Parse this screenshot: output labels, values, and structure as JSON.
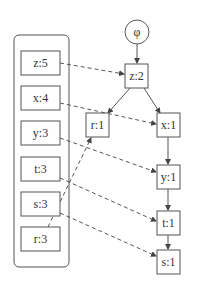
{
  "diagram": {
    "root": {
      "id": "phi",
      "label": "φ"
    },
    "left_group": {
      "items": [
        {
          "id": "z5",
          "label": "z:5"
        },
        {
          "id": "x4",
          "label": "x:4"
        },
        {
          "id": "y3",
          "label": "y:3"
        },
        {
          "id": "t3",
          "label": "t:3"
        },
        {
          "id": "s3",
          "label": "s:3"
        },
        {
          "id": "r3",
          "label": "r:3"
        }
      ]
    },
    "tree_nodes": [
      {
        "id": "z2",
        "label": "z:2"
      },
      {
        "id": "r1",
        "label": "r:1"
      },
      {
        "id": "x1",
        "label": "x:1"
      },
      {
        "id": "y1",
        "label": "y:1"
      },
      {
        "id": "t1",
        "label": "t:1"
      },
      {
        "id": "s1",
        "label": "s:1"
      }
    ],
    "solid_edges": [
      {
        "from": "phi",
        "to": "z2"
      },
      {
        "from": "z2",
        "to": "r1"
      },
      {
        "from": "z2",
        "to": "x1"
      },
      {
        "from": "x1",
        "to": "y1"
      },
      {
        "from": "y1",
        "to": "t1"
      },
      {
        "from": "t1",
        "to": "s1"
      }
    ],
    "dashed_links": [
      {
        "from": "z5",
        "to": "z2"
      },
      {
        "from": "x4",
        "to": "x1"
      },
      {
        "from": "y3",
        "to": "y1"
      },
      {
        "from": "t3",
        "to": "t1"
      },
      {
        "from": "s3",
        "to": "s1"
      },
      {
        "from": "r3",
        "to": "r1"
      }
    ]
  }
}
